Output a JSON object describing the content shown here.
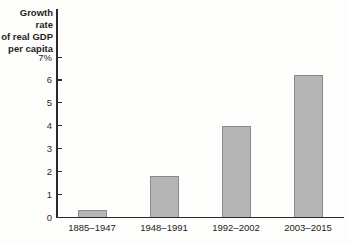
{
  "chart_data": {
    "type": "bar",
    "title": "",
    "ylabel": "Growth rate of real GDP per capita",
    "ylabel_lines": [
      "Growth rate",
      "of real GDP",
      "per capita"
    ],
    "xlabel": "",
    "categories": [
      "1885–1947",
      "1948–1991",
      "1992–2002",
      "2003–2015"
    ],
    "values": [
      0.3,
      1.8,
      4.0,
      6.2
    ],
    "ylim": [
      0,
      7
    ],
    "yticks": [
      0,
      1,
      2,
      3,
      4,
      5,
      6,
      7
    ],
    "ytick_labels": [
      "0",
      "1",
      "2",
      "3",
      "4",
      "5",
      "6",
      "7%"
    ],
    "grid": false,
    "legend": "none",
    "colors": {
      "bar_fill": "#b5b5b5",
      "bar_border": "#8a8a8a",
      "axis": "#2b2b2b",
      "text": "#1f1f1f",
      "background": "#fdfdfb"
    }
  }
}
